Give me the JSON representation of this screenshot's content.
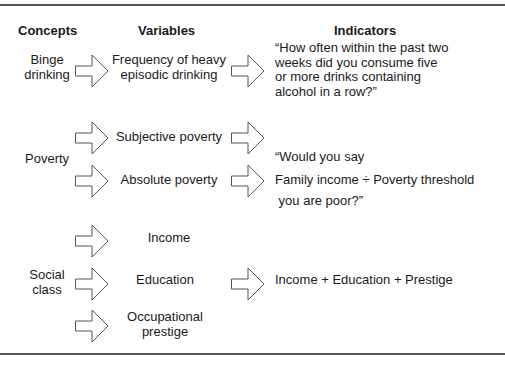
{
  "headers": {
    "concepts": "Concepts",
    "variables": "Variables",
    "indicators": "Indicators"
  },
  "rows": {
    "binge": {
      "concept": [
        "Binge",
        "drinking"
      ],
      "variable": [
        "Frequency of heavy",
        "episodic drinking"
      ],
      "indicator": [
        "“How often within the past two",
        "weeks did you consume five",
        "or more drinks containing",
        "alcohol in a row?”"
      ]
    },
    "poverty": {
      "concept": "Poverty",
      "variables": [
        "Subjective poverty",
        "Absolute poverty"
      ],
      "indicators": {
        "subjective": [
          "“Would you say",
          " you are poor?”"
        ],
        "absolute": "Family income ÷ Poverty threshold"
      }
    },
    "social_class": {
      "concept": [
        "Social",
        "class"
      ],
      "variables": {
        "income": "Income",
        "education": "Education",
        "prestige": [
          "Occupational",
          "prestige"
        ]
      },
      "indicator": "Income + Education + Prestige"
    }
  },
  "icons": {
    "arrow": "right-block-arrow-outline"
  }
}
